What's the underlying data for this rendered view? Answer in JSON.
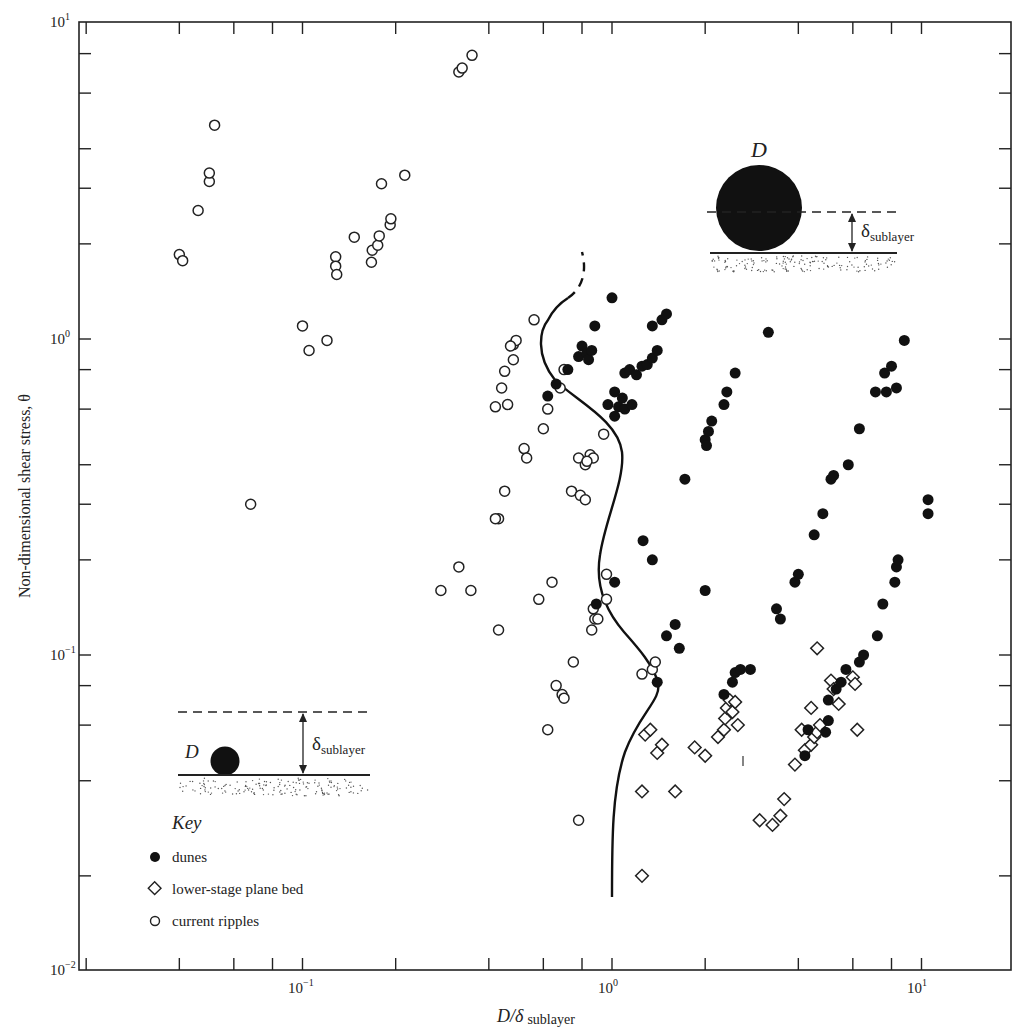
{
  "chart_data": {
    "type": "scatter",
    "title": "",
    "xlabel": "D/δ sublayer",
    "ylabel": "Non-dimensional shear stress, θ",
    "xscale": "log",
    "yscale": "log",
    "xlim": [
      0.02,
      20
    ],
    "ylim": [
      0.01,
      10
    ],
    "x_tick_labels": [
      "10^-1",
      "10^0",
      "10^1"
    ],
    "y_tick_labels": [
      "10^-2",
      "10^-1",
      "10^0",
      "10^1"
    ],
    "grid": false,
    "legend": {
      "title": "Key",
      "position": "lower left",
      "entries": [
        {
          "marker": "filled-circle",
          "label": "dunes"
        },
        {
          "marker": "open-diamond",
          "label": "lower-stage plane bed"
        },
        {
          "marker": "open-circle",
          "label": "current ripples"
        }
      ]
    },
    "annotations": [
      {
        "text": "D",
        "description": "large grain (D) protruding above viscous sublayer thickness δ sublayer",
        "position": "upper right"
      },
      {
        "text": "δ sublayer",
        "position": "upper right"
      },
      {
        "text": "D",
        "description": "small grain (D) buried within viscous sublayer thickness δ sublayer",
        "position": "lower left"
      },
      {
        "text": "δ sublayer",
        "position": "lower left"
      },
      {
        "text": "boundary curve",
        "description": "solid wavy line (dashed at top) separating current ripples from dunes / lower-stage plane bed near D/δ ≈ 1"
      }
    ],
    "series": [
      {
        "name": "current ripples",
        "marker": "open-circle",
        "points": [
          [
            0.04,
            1.85
          ],
          [
            0.041,
            1.77
          ],
          [
            0.046,
            2.55
          ],
          [
            0.05,
            3.15
          ],
          [
            0.05,
            3.35
          ],
          [
            0.052,
            4.75
          ],
          [
            0.1,
            1.1
          ],
          [
            0.105,
            0.92
          ],
          [
            0.12,
            0.99
          ],
          [
            0.128,
            1.82
          ],
          [
            0.128,
            1.7
          ],
          [
            0.129,
            1.6
          ],
          [
            0.147,
            2.1
          ],
          [
            0.167,
            1.75
          ],
          [
            0.168,
            1.91
          ],
          [
            0.175,
            1.98
          ],
          [
            0.177,
            2.12
          ],
          [
            0.192,
            2.3
          ],
          [
            0.193,
            2.4
          ],
          [
            0.18,
            3.1
          ],
          [
            0.214,
            3.3
          ],
          [
            0.32,
            7.0
          ],
          [
            0.328,
            7.2
          ],
          [
            0.353,
            7.9
          ],
          [
            0.068,
            0.3
          ],
          [
            0.42,
            0.61
          ],
          [
            0.44,
            0.7
          ],
          [
            0.45,
            0.79
          ],
          [
            0.48,
            0.86
          ],
          [
            0.48,
            0.96
          ],
          [
            0.49,
            0.99
          ],
          [
            0.47,
            0.95
          ],
          [
            0.56,
            1.15
          ],
          [
            0.46,
            0.62
          ],
          [
            0.45,
            0.33
          ],
          [
            0.43,
            0.27
          ],
          [
            0.42,
            0.27
          ],
          [
            0.52,
            0.45
          ],
          [
            0.53,
            0.42
          ],
          [
            0.6,
            0.52
          ],
          [
            0.62,
            0.6
          ],
          [
            0.68,
            0.7
          ],
          [
            0.7,
            0.8
          ],
          [
            0.74,
            0.33
          ],
          [
            0.79,
            0.32
          ],
          [
            0.82,
            0.31
          ],
          [
            0.78,
            0.42
          ],
          [
            0.82,
            0.4
          ],
          [
            0.85,
            0.43
          ],
          [
            0.87,
            0.42
          ],
          [
            0.83,
            0.41
          ],
          [
            0.28,
            0.16
          ],
          [
            0.32,
            0.19
          ],
          [
            0.35,
            0.16
          ],
          [
            0.43,
            0.12
          ],
          [
            0.58,
            0.15
          ],
          [
            0.64,
            0.17
          ],
          [
            0.87,
            0.14
          ],
          [
            0.88,
            0.13
          ],
          [
            0.86,
            0.12
          ],
          [
            0.9,
            0.13
          ],
          [
            0.96,
            0.18
          ],
          [
            0.96,
            0.15
          ],
          [
            0.94,
            0.5
          ],
          [
            0.75,
            0.095
          ],
          [
            0.66,
            0.08
          ],
          [
            0.69,
            0.075
          ],
          [
            0.7,
            0.073
          ],
          [
            0.62,
            0.058
          ],
          [
            0.78,
            0.03
          ],
          [
            1.25,
            0.087
          ],
          [
            1.35,
            0.09
          ],
          [
            1.38,
            0.095
          ]
        ]
      },
      {
        "name": "dunes",
        "marker": "filled-circle",
        "points": [
          [
            0.72,
            0.8
          ],
          [
            0.78,
            0.88
          ],
          [
            0.8,
            0.95
          ],
          [
            0.83,
            0.9
          ],
          [
            0.84,
            0.86
          ],
          [
            0.86,
            0.92
          ],
          [
            0.88,
            1.1
          ],
          [
            1.0,
            1.35
          ],
          [
            0.62,
            0.66
          ],
          [
            0.66,
            0.72
          ],
          [
            0.97,
            0.62
          ],
          [
            1.02,
            0.57
          ],
          [
            1.05,
            0.61
          ],
          [
            1.08,
            0.65
          ],
          [
            1.1,
            0.6
          ],
          [
            1.02,
            0.68
          ],
          [
            1.16,
            0.62
          ],
          [
            1.1,
            0.78
          ],
          [
            1.14,
            0.8
          ],
          [
            1.2,
            0.77
          ],
          [
            1.25,
            0.82
          ],
          [
            1.3,
            0.83
          ],
          [
            1.35,
            0.87
          ],
          [
            1.4,
            0.92
          ],
          [
            1.35,
            1.1
          ],
          [
            1.45,
            1.15
          ],
          [
            1.5,
            1.2
          ],
          [
            1.26,
            0.23
          ],
          [
            1.35,
            0.2
          ],
          [
            1.72,
            0.36
          ],
          [
            2.0,
            0.48
          ],
          [
            2.02,
            0.46
          ],
          [
            2.05,
            0.51
          ],
          [
            2.1,
            0.55
          ],
          [
            2.3,
            0.62
          ],
          [
            2.35,
            0.68
          ],
          [
            2.5,
            0.78
          ],
          [
            3.2,
            1.05
          ],
          [
            0.89,
            0.145
          ],
          [
            1.02,
            0.17
          ],
          [
            1.5,
            0.115
          ],
          [
            1.6,
            0.125
          ],
          [
            1.65,
            0.105
          ],
          [
            1.4,
            0.082
          ],
          [
            2.0,
            0.16
          ],
          [
            2.3,
            0.075
          ],
          [
            2.45,
            0.082
          ],
          [
            2.5,
            0.088
          ],
          [
            2.6,
            0.09
          ],
          [
            2.8,
            0.09
          ],
          [
            3.4,
            0.14
          ],
          [
            3.5,
            0.13
          ],
          [
            3.9,
            0.17
          ],
          [
            4.0,
            0.18
          ],
          [
            4.5,
            0.24
          ],
          [
            4.8,
            0.28
          ],
          [
            5.1,
            0.36
          ],
          [
            5.2,
            0.37
          ],
          [
            5.8,
            0.4
          ],
          [
            6.3,
            0.52
          ],
          [
            7.1,
            0.68
          ],
          [
            7.7,
            0.68
          ],
          [
            7.6,
            0.78
          ],
          [
            8.0,
            0.82
          ],
          [
            8.3,
            0.7
          ],
          [
            8.8,
            0.99
          ],
          [
            4.2,
            0.048
          ],
          [
            4.3,
            0.058
          ],
          [
            4.9,
            0.057
          ],
          [
            5.0,
            0.062
          ],
          [
            5.0,
            0.072
          ],
          [
            5.3,
            0.078
          ],
          [
            5.5,
            0.082
          ],
          [
            5.7,
            0.09
          ],
          [
            6.3,
            0.095
          ],
          [
            6.5,
            0.1
          ],
          [
            7.2,
            0.115
          ],
          [
            7.5,
            0.145
          ],
          [
            8.2,
            0.17
          ],
          [
            8.3,
            0.19
          ],
          [
            8.4,
            0.2
          ],
          [
            10.5,
            0.28
          ],
          [
            10.5,
            0.31
          ]
        ]
      },
      {
        "name": "lower-stage plane bed",
        "marker": "open-diamond",
        "points": [
          [
            1.28,
            0.056
          ],
          [
            1.33,
            0.058
          ],
          [
            1.4,
            0.049
          ],
          [
            1.45,
            0.052
          ],
          [
            1.25,
            0.037
          ],
          [
            1.6,
            0.037
          ],
          [
            1.25,
            0.02
          ],
          [
            1.85,
            0.051
          ],
          [
            2.0,
            0.048
          ],
          [
            2.2,
            0.055
          ],
          [
            2.3,
            0.058
          ],
          [
            2.32,
            0.063
          ],
          [
            2.35,
            0.068
          ],
          [
            2.4,
            0.072
          ],
          [
            2.45,
            0.066
          ],
          [
            2.55,
            0.06
          ],
          [
            2.5,
            0.071
          ],
          [
            3.0,
            0.03
          ],
          [
            3.3,
            0.029
          ],
          [
            3.5,
            0.031
          ],
          [
            3.6,
            0.035
          ],
          [
            3.9,
            0.045
          ],
          [
            4.1,
            0.058
          ],
          [
            4.2,
            0.05
          ],
          [
            4.4,
            0.052
          ],
          [
            4.5,
            0.055
          ],
          [
            4.6,
            0.057
          ],
          [
            4.4,
            0.068
          ],
          [
            4.7,
            0.06
          ],
          [
            4.6,
            0.105
          ],
          [
            5.1,
            0.083
          ],
          [
            5.2,
            0.078
          ],
          [
            5.4,
            0.07
          ],
          [
            6.0,
            0.085
          ],
          [
            6.1,
            0.081
          ],
          [
            6.2,
            0.058
          ]
        ]
      }
    ],
    "boundary_curve": {
      "style": "solid with dashed upper segment",
      "approx_points": [
        [
          1.0,
          0.018
        ],
        [
          1.02,
          0.03
        ],
        [
          1.12,
          0.05
        ],
        [
          1.38,
          0.075
        ],
        [
          1.35,
          0.09
        ],
        [
          1.0,
          0.14
        ],
        [
          0.9,
          0.2
        ],
        [
          0.95,
          0.3
        ],
        [
          1.15,
          0.42
        ],
        [
          0.9,
          0.55
        ],
        [
          0.68,
          0.8
        ],
        [
          0.65,
          1.1
        ],
        [
          0.72,
          1.3
        ]
      ],
      "dashed_segment": [
        [
          0.72,
          1.3
        ],
        [
          0.78,
          1.6
        ],
        [
          0.75,
          1.9
        ]
      ]
    }
  },
  "labels": {
    "xlabel_main": "D/δ",
    "xlabel_sub": "sublayer",
    "ylabel": "Non-dimensional shear stress, θ",
    "x_ticks": [
      {
        "base": "10",
        "exp": "−1",
        "px": 302
      },
      {
        "base": "10",
        "exp": "0",
        "px": 612
      },
      {
        "base": "10",
        "exp": "1",
        "px": 921
      }
    ],
    "y_ticks": [
      {
        "base": "10",
        "exp": "1",
        "py": 22
      },
      {
        "base": "10",
        "exp": "0",
        "py": 339
      },
      {
        "base": "10",
        "exp": "−1",
        "py": 655
      },
      {
        "base": "10",
        "exp": "−2",
        "py": 970
      }
    ],
    "key_title": "Key",
    "key_dunes": "dunes",
    "key_plane_bed": "lower-stage plane bed",
    "key_ripples": "current ripples",
    "inset_d": "D",
    "inset_delta": "δ",
    "inset_sub": "sublayer"
  }
}
